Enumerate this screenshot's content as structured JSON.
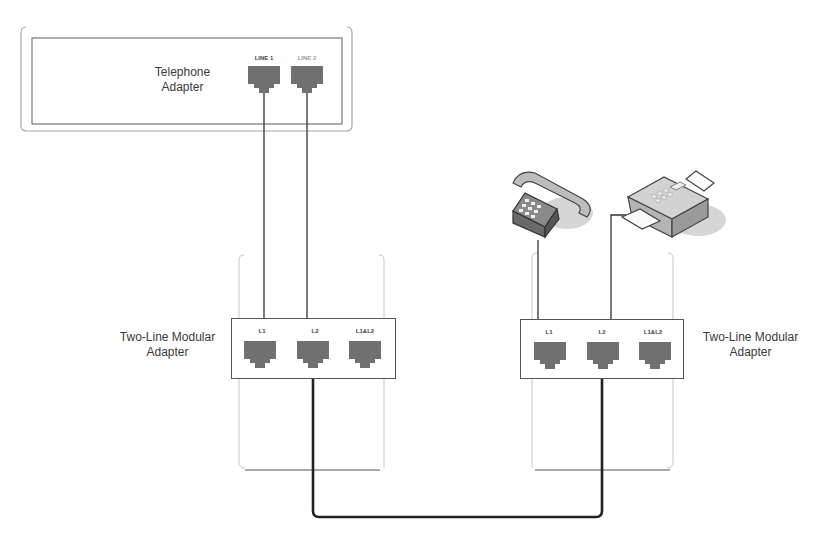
{
  "diagram": {
    "telephone_adapter": {
      "label_line1": "Telephone",
      "label_line2": "Adapter",
      "ports": [
        {
          "label": "LINE 1"
        },
        {
          "label": "LINE 2"
        }
      ]
    },
    "left_modular_adapter": {
      "label_line1": "Two-Line Modular",
      "label_line2": "Adapter",
      "ports": [
        {
          "label": "L1"
        },
        {
          "label": "L2"
        },
        {
          "label": "L1&L2"
        }
      ]
    },
    "right_modular_adapter": {
      "label_line1": "Two-Line Modular",
      "label_line2": "Adapter",
      "ports": [
        {
          "label": "L1"
        },
        {
          "label": "L2"
        },
        {
          "label": "L1&L2"
        }
      ]
    },
    "devices": [
      {
        "name": "telephone",
        "icon": "telephone-icon"
      },
      {
        "name": "fax",
        "icon": "fax-machine-icon"
      }
    ],
    "connections": [
      {
        "from": "telephone_adapter.LINE 1",
        "to": "left_modular_adapter.L1"
      },
      {
        "from": "telephone_adapter.LINE 2",
        "to": "left_modular_adapter.L2"
      },
      {
        "from": "left_modular_adapter.L2",
        "to": "right_modular_adapter.L2",
        "style": "thick"
      },
      {
        "from": "telephone",
        "to": "right_modular_adapter.L1"
      },
      {
        "from": "fax",
        "to": "right_modular_adapter.L2"
      }
    ],
    "colors": {
      "line": "#333333",
      "thick_cable": "#222222",
      "jack_fill": "#6e6e6e",
      "frame": "#9a9a9a",
      "bracket": "#bdbdbd"
    }
  }
}
